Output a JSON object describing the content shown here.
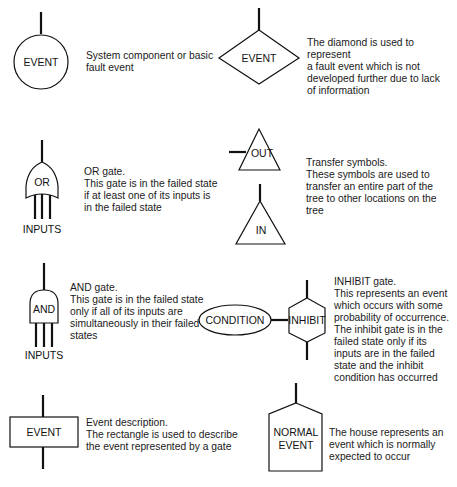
{
  "symbols": {
    "basic_event": {
      "label": "EVENT",
      "description": "System component or basic\nfault event"
    },
    "undeveloped_event": {
      "label": "EVENT",
      "description": "The diamond is used to represent\na fault event which is not\ndeveloped further due to lack\nof information"
    },
    "or_gate": {
      "label": "OR",
      "inputs_label": "INPUTS",
      "description": "OR gate.\nThis gate is in the failed state\nif at least one of its inputs is\nin the failed state"
    },
    "transfer": {
      "out_label": "OUT",
      "in_label": "IN",
      "description": "Transfer symbols.\nThese symbols are used to\ntransfer an entire part of the\ntree to other locations on the\ntree"
    },
    "and_gate": {
      "label": "AND",
      "inputs_label": "INPUTS",
      "description": "AND gate.\nThis gate is in the failed state\nonly if all of its inputs are\nsimultaneously in their failed\nstates"
    },
    "inhibit_gate": {
      "condition_label": "CONDITION",
      "label": "INHIBIT",
      "description": "INHIBIT gate.\nThis represents an event\nwhich occurs with some\nprobability of occurrence.\nThe inhibit gate is in the\nfailed state only if its\ninputs are in the failed\nstate and the inhibit\ncondition has occurred"
    },
    "event_description": {
      "label": "EVENT",
      "description": "Event description.\nThe rectangle is used to describe\nthe event represented by a gate"
    },
    "house_event": {
      "label_line1": "NORMAL",
      "label_line2": "EVENT",
      "description": "The house represents an\nevent which is normally\nexpected to occur"
    }
  }
}
